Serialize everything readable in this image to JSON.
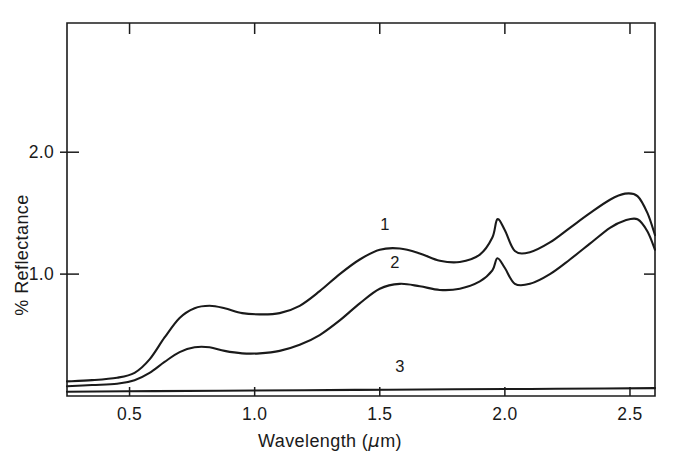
{
  "figure": {
    "background_color": "#ffffff",
    "ink_color": "#1a1a1a"
  },
  "axes": {
    "x": {
      "label_text": "Wavelength (",
      "label_unit_mu": "μ",
      "label_unit_tail": "m)",
      "full_label": "Wavelength (μm)",
      "ticks": [
        "0.5",
        "1.0",
        "1.5",
        "2.0",
        "2.5"
      ],
      "tick_values": [
        0.5,
        1.0,
        1.5,
        2.0,
        2.5
      ],
      "range": [
        0.25,
        2.6
      ]
    },
    "y": {
      "label": "% Reflectance",
      "ticks": [
        "1.0",
        "2.0"
      ],
      "tick_values": [
        1.0,
        2.0
      ],
      "range": [
        0.0,
        3.06
      ]
    }
  },
  "curve_labels": {
    "one": "1",
    "two": "2",
    "three": "3"
  },
  "chart_data": {
    "type": "line",
    "title": "",
    "xlabel": "Wavelength (μm)",
    "ylabel": "% Reflectance",
    "xlim": [
      0.25,
      2.6
    ],
    "ylim": [
      0.0,
      3.06
    ],
    "grid": false,
    "legend_position": "inline-curve-labels",
    "xticks": [
      0.5,
      1.0,
      1.5,
      2.0,
      2.5
    ],
    "yticks": [
      1.0,
      2.0
    ],
    "series": [
      {
        "name": "1",
        "label": "1",
        "label_x": 1.52,
        "label_y": 1.36,
        "x": [
          0.25,
          0.35,
          0.45,
          0.52,
          0.58,
          0.64,
          0.7,
          0.76,
          0.82,
          0.88,
          0.95,
          1.02,
          1.1,
          1.18,
          1.26,
          1.34,
          1.42,
          1.5,
          1.58,
          1.66,
          1.74,
          1.82,
          1.9,
          1.95,
          1.97,
          2.0,
          2.04,
          2.1,
          2.18,
          2.26,
          2.34,
          2.42,
          2.48,
          2.53,
          2.57,
          2.6
        ],
        "y": [
          0.12,
          0.13,
          0.15,
          0.19,
          0.3,
          0.48,
          0.64,
          0.72,
          0.74,
          0.72,
          0.68,
          0.67,
          0.68,
          0.74,
          0.86,
          1.0,
          1.12,
          1.2,
          1.21,
          1.17,
          1.11,
          1.1,
          1.16,
          1.3,
          1.45,
          1.36,
          1.19,
          1.18,
          1.26,
          1.38,
          1.5,
          1.61,
          1.66,
          1.64,
          1.5,
          1.32
        ]
      },
      {
        "name": "2",
        "label": "2",
        "label_x": 1.56,
        "label_y": 1.05,
        "x": [
          0.25,
          0.35,
          0.45,
          0.52,
          0.58,
          0.64,
          0.7,
          0.76,
          0.82,
          0.88,
          0.95,
          1.02,
          1.1,
          1.18,
          1.26,
          1.34,
          1.42,
          1.5,
          1.58,
          1.66,
          1.74,
          1.82,
          1.9,
          1.95,
          1.97,
          2.0,
          2.04,
          2.1,
          2.18,
          2.26,
          2.34,
          2.42,
          2.48,
          2.53,
          2.57,
          2.6
        ],
        "y": [
          0.08,
          0.09,
          0.1,
          0.13,
          0.19,
          0.28,
          0.36,
          0.4,
          0.4,
          0.37,
          0.35,
          0.35,
          0.37,
          0.42,
          0.5,
          0.62,
          0.76,
          0.88,
          0.92,
          0.9,
          0.87,
          0.88,
          0.94,
          1.03,
          1.13,
          1.05,
          0.92,
          0.92,
          1.0,
          1.12,
          1.25,
          1.38,
          1.44,
          1.45,
          1.35,
          1.2
        ]
      },
      {
        "name": "3",
        "label": "3",
        "label_x": 1.58,
        "label_y": 0.2,
        "x": [
          0.25,
          0.6,
          1.0,
          1.4,
          1.8,
          2.1,
          2.4,
          2.6
        ],
        "y": [
          0.035,
          0.04,
          0.045,
          0.05,
          0.055,
          0.058,
          0.062,
          0.065
        ]
      }
    ]
  }
}
